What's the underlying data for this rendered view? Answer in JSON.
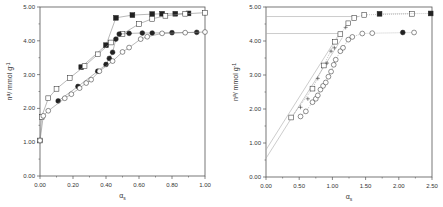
{
  "chart_data": [
    {
      "type": "scatter",
      "title": "",
      "xlabel": "αs",
      "ylabel": "n^a / mmol g^-1",
      "xlim": [
        0,
        1.0
      ],
      "ylim": [
        0,
        5.0
      ],
      "x_ticks": [
        "0.00",
        "0.20",
        "0.40",
        "0.60",
        "0.80",
        "1.00"
      ],
      "y_ticks": [
        "0.00",
        "1.00",
        "2.00",
        "3.00",
        "4.00",
        "5.00"
      ],
      "grid": false,
      "legend": null,
      "series": [
        {
          "name": "filled-square",
          "marker": "square-filled",
          "line": "solid",
          "points": [
            [
              0.25,
              3.22
            ],
            [
              0.4,
              3.87
            ],
            [
              0.46,
              4.68
            ],
            [
              0.56,
              4.76
            ],
            [
              0.68,
              4.79
            ],
            [
              0.74,
              4.8
            ],
            [
              0.82,
              4.8
            ],
            [
              0.9,
              4.81
            ]
          ]
        },
        {
          "name": "open-square-cross",
          "marker": "square-open",
          "line": "solid",
          "points": [
            [
              0.0,
              1.05
            ],
            [
              0.01,
              1.75
            ],
            [
              0.05,
              2.3
            ],
            [
              0.1,
              2.58
            ],
            [
              0.18,
              2.9
            ],
            [
              0.27,
              3.25
            ],
            [
              0.35,
              3.6
            ],
            [
              0.43,
              3.95
            ],
            [
              0.5,
              4.2
            ],
            [
              0.6,
              4.5
            ],
            [
              0.68,
              4.65
            ],
            [
              0.76,
              4.74
            ],
            [
              0.88,
              4.8
            ],
            [
              1.0,
              4.83
            ]
          ]
        },
        {
          "name": "filled-circle",
          "marker": "circle-filled",
          "line": "solid",
          "points": [
            [
              0.11,
              2.22
            ],
            [
              0.23,
              2.65
            ],
            [
              0.35,
              3.1
            ],
            [
              0.4,
              3.3
            ],
            [
              0.42,
              3.48
            ],
            [
              0.44,
              3.66
            ],
            [
              0.46,
              4.05
            ],
            [
              0.48,
              4.2
            ],
            [
              0.54,
              4.22
            ],
            [
              0.62,
              4.23
            ],
            [
              0.68,
              4.23
            ],
            [
              0.8,
              4.24
            ],
            [
              0.95,
              4.25
            ]
          ]
        },
        {
          "name": "open-circle",
          "marker": "circle-open",
          "line": "solid",
          "points": [
            [
              0.0,
              1.05
            ],
            [
              0.02,
              1.78
            ],
            [
              0.05,
              1.93
            ],
            [
              0.15,
              2.3
            ],
            [
              0.19,
              2.42
            ],
            [
              0.24,
              2.6
            ],
            [
              0.28,
              2.75
            ],
            [
              0.31,
              2.85
            ],
            [
              0.36,
              3.1
            ],
            [
              0.44,
              3.4
            ],
            [
              0.5,
              3.67
            ],
            [
              0.54,
              3.8
            ],
            [
              0.61,
              4.05
            ],
            [
              0.65,
              4.12
            ],
            [
              0.74,
              4.22
            ],
            [
              0.88,
              4.24
            ],
            [
              1.0,
              4.26
            ]
          ]
        }
      ]
    },
    {
      "type": "scatter",
      "title": "",
      "xlabel": "αs",
      "ylabel": "n^a / mmol g^-1",
      "xlim": [
        0,
        2.5
      ],
      "ylim": [
        0,
        5.0
      ],
      "x_ticks": [
        "0.00",
        "0.50",
        "1.00",
        "1.50",
        "2.00",
        "2.50"
      ],
      "y_ticks": [
        "0.00",
        "1.00",
        "2.00",
        "3.00",
        "4.00",
        "5.00"
      ],
      "grid": false,
      "legend": null,
      "series": [
        {
          "name": "open-square",
          "marker": "square-open",
          "line": "dotted",
          "points": [
            [
              0.38,
              1.75
            ],
            [
              0.7,
              2.6
            ],
            [
              0.87,
              3.28
            ],
            [
              1.04,
              3.98
            ],
            [
              1.12,
              4.2
            ],
            [
              1.24,
              4.52
            ],
            [
              1.33,
              4.68
            ],
            [
              1.48,
              4.77
            ],
            [
              2.2,
              4.8
            ]
          ]
        },
        {
          "name": "cross",
          "marker": "cross",
          "line": "none",
          "points": [
            [
              0.52,
              2.05
            ],
            [
              0.63,
              2.3
            ],
            [
              0.78,
              2.9
            ],
            [
              0.92,
              3.35
            ],
            [
              0.98,
              3.7
            ],
            [
              1.03,
              3.8
            ],
            [
              1.2,
              4.4
            ]
          ]
        },
        {
          "name": "filled-square",
          "marker": "square-filled",
          "line": "dotted",
          "points": [
            [
              1.71,
              4.8
            ],
            [
              2.48,
              4.81
            ]
          ]
        },
        {
          "name": "open-circle",
          "marker": "circle-open",
          "line": "dotted",
          "points": [
            [
              0.52,
              1.78
            ],
            [
              0.6,
              1.93
            ],
            [
              0.7,
              2.2
            ],
            [
              0.75,
              2.3
            ],
            [
              0.78,
              2.4
            ],
            [
              0.82,
              2.57
            ],
            [
              0.86,
              2.68
            ],
            [
              0.9,
              2.78
            ],
            [
              0.94,
              2.95
            ],
            [
              0.98,
              3.1
            ],
            [
              1.02,
              3.3
            ],
            [
              1.05,
              3.45
            ],
            [
              1.12,
              3.7
            ],
            [
              1.16,
              3.8
            ],
            [
              1.24,
              4.04
            ],
            [
              1.3,
              4.12
            ],
            [
              1.45,
              4.22
            ],
            [
              1.6,
              4.23
            ],
            [
              2.23,
              4.25
            ]
          ]
        },
        {
          "name": "filled-circle",
          "marker": "circle-filled",
          "line": "dotted",
          "points": [
            [
              2.06,
              4.25
            ]
          ]
        }
      ],
      "fit_lines": [
        {
          "name": "fit-upper",
          "from": [
            0.0,
            0.8
          ],
          "to": [
            1.1,
            4.2
          ]
        },
        {
          "name": "fit-lower",
          "from": [
            0.0,
            0.55
          ],
          "to": [
            1.15,
            4.1
          ]
        },
        {
          "name": "plateau-4.72",
          "from": [
            0.0,
            4.72
          ],
          "to": [
            1.4,
            4.72
          ]
        },
        {
          "name": "plateau-4.22",
          "from": [
            0.0,
            4.22
          ],
          "to": [
            1.15,
            4.22
          ]
        }
      ]
    }
  ],
  "plots": {
    "left": {
      "ylabel": "n",
      "ylabel_sup": "a",
      "ylabel_rest": "/ mmol g",
      "ylabel_exp": "-1",
      "xlabel": "α",
      "xlabel_sub": "s"
    },
    "right": {
      "ylabel": "n",
      "ylabel_sup": "a",
      "ylabel_rest": "/ mmol g",
      "ylabel_exp": "-1",
      "xlabel": "α",
      "xlabel_sub": "s"
    }
  },
  "colors": {
    "axis": "#555555",
    "marker": "#222222",
    "line": "#888888",
    "fit_line": "#aaaaaa"
  }
}
